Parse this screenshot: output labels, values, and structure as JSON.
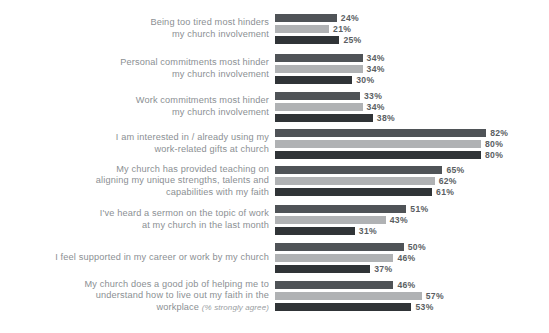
{
  "chart_data": {
    "type": "bar",
    "orientation": "horizontal",
    "title": "",
    "subtitle": "",
    "xlabel": "",
    "ylabel": "",
    "xlim": [
      0,
      100
    ],
    "grid": false,
    "legend_position": "none",
    "value_suffix": "%",
    "categories": [
      "Being too tired most hinders my church involvement",
      "Personal commitments most hinder my church involvement",
      "Work commitments most hinder my church involvement",
      "I am interested in / already using my work-related gifts at church",
      "My church has provided teaching on aligning my unique strengths, talents and capabilities with my faith",
      "I've heard a sermon on the topic of work at my church in the last month",
      "I feel supported in my career or work by my church",
      "My church does a good job of helping me to understand how to live out my faith in the workplace"
    ],
    "series": [
      {
        "name": "series-1",
        "color": "#4f5357",
        "values": [
          24,
          34,
          33,
          82,
          65,
          51,
          50,
          46
        ]
      },
      {
        "name": "series-2",
        "color": "#b0b2b4",
        "values": [
          21,
          34,
          34,
          80,
          62,
          43,
          46,
          57
        ]
      },
      {
        "name": "series-3",
        "color": "#303437",
        "values": [
          25,
          30,
          38,
          80,
          61,
          31,
          37,
          53
        ]
      }
    ]
  },
  "rows": [
    {
      "label_lines": [
        "Being too tired most hinders",
        "my church involvement"
      ],
      "note": "",
      "values": [
        "24%",
        "21%",
        "25%"
      ]
    },
    {
      "label_lines": [
        "Personal commitments most hinder",
        "my church involvement"
      ],
      "note": "",
      "values": [
        "34%",
        "34%",
        "30%"
      ]
    },
    {
      "label_lines": [
        "Work commitments most hinder",
        "my church involvement"
      ],
      "note": "",
      "values": [
        "33%",
        "34%",
        "38%"
      ]
    },
    {
      "label_lines": [
        "I am interested in / already using my",
        "work-related gifts at church"
      ],
      "note": "",
      "values": [
        "82%",
        "80%",
        "80%"
      ]
    },
    {
      "label_lines": [
        "My church has provided teaching on",
        "aligning my unique strengths, talents and",
        "capabilities with my faith"
      ],
      "note": "",
      "values": [
        "65%",
        "62%",
        "61%"
      ]
    },
    {
      "label_lines": [
        "I've heard a sermon on the topic of work",
        "at my church in the last month"
      ],
      "note": "",
      "values": [
        "51%",
        "43%",
        "31%"
      ]
    },
    {
      "label_lines": [
        "I feel supported in my career or work by my church"
      ],
      "note": "",
      "values": [
        "50%",
        "46%",
        "37%"
      ]
    },
    {
      "label_lines": [
        "My church does a good job of helping me to",
        "understand how to live out my faith in the",
        "workplace"
      ],
      "note": "(% strongly agree)",
      "values": [
        "46%",
        "57%",
        "53%"
      ]
    }
  ],
  "layout": {
    "bar_origin_x": 279,
    "px_per_percent": 2.575,
    "bar_height": 8,
    "bar_gap": 3,
    "row_tops": [
      14,
      54,
      92,
      129,
      166,
      205,
      243,
      281
    ]
  },
  "colors": {
    "background": "#ffffff",
    "label_text": "#8b8f93",
    "value_text": "#5a5e62",
    "series_1": "#4f5357",
    "series_2": "#b0b2b4",
    "series_3": "#303437"
  }
}
